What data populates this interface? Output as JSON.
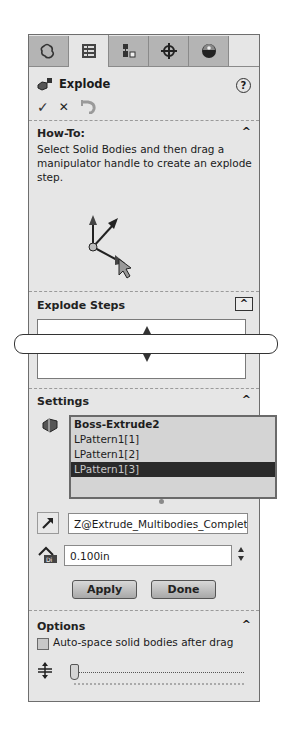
{
  "tabs": [
    {
      "icon": "feature-manager-icon",
      "active": false
    },
    {
      "icon": "property-manager-icon",
      "active": true
    },
    {
      "icon": "configuration-manager-icon",
      "active": false
    },
    {
      "icon": "dimxpert-manager-icon",
      "active": false
    },
    {
      "icon": "display-manager-icon",
      "active": false
    }
  ],
  "header": {
    "title": "Explode",
    "help_label": "?",
    "ok_label": "✓",
    "cancel_label": "✕"
  },
  "howto": {
    "title": "How-To:",
    "text": "Select Solid Bodies and then drag a manipulator handle to create an explode step.",
    "caret": "^"
  },
  "explode_steps": {
    "title": "Explode Steps",
    "caret": "^"
  },
  "settings": {
    "title": "Settings",
    "caret": "^",
    "bodies": [
      {
        "label": "Boss-Extrude2",
        "selected": false
      },
      {
        "label": "LPattern1[1]",
        "selected": false
      },
      {
        "label": "LPattern1[2]",
        "selected": false
      },
      {
        "label": "LPattern1[3]",
        "selected": true
      }
    ],
    "direction_value": "Z@Extrude_Multibodies_Complete",
    "distance_value": "0.100in",
    "apply_label": "Apply",
    "done_label": "Done"
  },
  "options": {
    "title": "Options",
    "caret": "^",
    "auto_space_label": "Auto-space solid bodies after drag",
    "auto_space_checked": false
  }
}
